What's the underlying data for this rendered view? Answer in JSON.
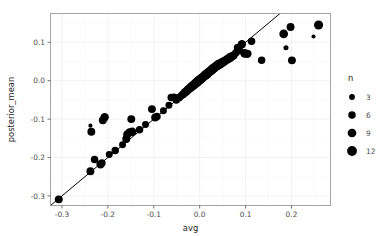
{
  "chart_data": {
    "type": "scatter",
    "title": "",
    "subtitle": "",
    "xlabel": "avg",
    "ylabel": "posterior_mean",
    "xlim": [
      -0.325,
      0.285
    ],
    "ylim": [
      -0.325,
      0.175
    ],
    "xticks": [
      -0.3,
      -0.2,
      -0.1,
      0.0,
      0.1,
      0.2
    ],
    "xticklabels": [
      "-0.3",
      "-0.2",
      "-0.1",
      "0.0",
      "0.1",
      "0.2"
    ],
    "yticks": [
      0.1,
      0.0,
      -0.1,
      -0.2,
      -0.3
    ],
    "yticklabels": [
      "0.1",
      "0.0",
      "-0.1",
      "-0.2",
      "-0.3"
    ],
    "grid": true,
    "grid_color": "#ececec",
    "point_color": "#000000",
    "size_variable": "n",
    "reference_line": {
      "type": "abline",
      "slope": 1,
      "intercept": 0,
      "color": "#000000"
    },
    "legend": {
      "title": "n",
      "position": "right",
      "entries": [
        {
          "label": "3",
          "value": 3
        },
        {
          "label": "6",
          "value": 6
        },
        {
          "label": "9",
          "value": 9
        },
        {
          "label": "12",
          "value": 12
        }
      ]
    },
    "points": [
      {
        "x": -0.307,
        "y": -0.309,
        "n": 7
      },
      {
        "x": -0.238,
        "y": -0.236,
        "n": 7
      },
      {
        "x": -0.236,
        "y": -0.133,
        "n": 7
      },
      {
        "x": -0.238,
        "y": -0.117,
        "n": 1
      },
      {
        "x": -0.229,
        "y": -0.205,
        "n": 6
      },
      {
        "x": -0.216,
        "y": -0.218,
        "n": 8
      },
      {
        "x": -0.213,
        "y": -0.214,
        "n": 6
      },
      {
        "x": -0.211,
        "y": -0.103,
        "n": 7
      },
      {
        "x": -0.207,
        "y": -0.095,
        "n": 8
      },
      {
        "x": -0.197,
        "y": -0.192,
        "n": 5
      },
      {
        "x": -0.184,
        "y": -0.182,
        "n": 6
      },
      {
        "x": -0.168,
        "y": -0.167,
        "n": 5
      },
      {
        "x": -0.16,
        "y": -0.152,
        "n": 7
      },
      {
        "x": -0.158,
        "y": -0.14,
        "n": 7
      },
      {
        "x": -0.153,
        "y": -0.135,
        "n": 8
      },
      {
        "x": -0.149,
        "y": -0.1,
        "n": 7
      },
      {
        "x": -0.147,
        "y": -0.133,
        "n": 8
      },
      {
        "x": -0.131,
        "y": -0.128,
        "n": 6
      },
      {
        "x": -0.118,
        "y": -0.114,
        "n": 5
      },
      {
        "x": -0.104,
        "y": -0.074,
        "n": 7
      },
      {
        "x": -0.097,
        "y": -0.096,
        "n": 7
      },
      {
        "x": -0.093,
        "y": -0.093,
        "n": 6
      },
      {
        "x": -0.079,
        "y": -0.078,
        "n": 5
      },
      {
        "x": -0.067,
        "y": -0.064,
        "n": 5
      },
      {
        "x": -0.062,
        "y": -0.044,
        "n": 6
      },
      {
        "x": -0.056,
        "y": -0.043,
        "n": 6
      },
      {
        "x": -0.051,
        "y": -0.05,
        "n": 6
      },
      {
        "x": -0.045,
        "y": -0.044,
        "n": 7
      },
      {
        "x": -0.04,
        "y": -0.039,
        "n": 6
      },
      {
        "x": -0.036,
        "y": -0.035,
        "n": 7
      },
      {
        "x": -0.032,
        "y": -0.03,
        "n": 8
      },
      {
        "x": -0.029,
        "y": -0.028,
        "n": 8
      },
      {
        "x": -0.026,
        "y": -0.024,
        "n": 9
      },
      {
        "x": -0.023,
        "y": -0.021,
        "n": 9
      },
      {
        "x": -0.02,
        "y": -0.018,
        "n": 9
      },
      {
        "x": -0.017,
        "y": -0.015,
        "n": 10
      },
      {
        "x": -0.014,
        "y": -0.012,
        "n": 10
      },
      {
        "x": -0.011,
        "y": -0.009,
        "n": 10
      },
      {
        "x": -0.008,
        "y": -0.006,
        "n": 10
      },
      {
        "x": -0.005,
        "y": -0.003,
        "n": 11
      },
      {
        "x": -0.002,
        "y": 0.0,
        "n": 11
      },
      {
        "x": 0.001,
        "y": 0.003,
        "n": 11
      },
      {
        "x": 0.004,
        "y": 0.006,
        "n": 11
      },
      {
        "x": 0.007,
        "y": 0.009,
        "n": 10
      },
      {
        "x": 0.01,
        "y": 0.012,
        "n": 10
      },
      {
        "x": 0.013,
        "y": 0.015,
        "n": 11
      },
      {
        "x": 0.016,
        "y": 0.018,
        "n": 11
      },
      {
        "x": 0.019,
        "y": 0.021,
        "n": 10
      },
      {
        "x": 0.022,
        "y": 0.024,
        "n": 10
      },
      {
        "x": 0.025,
        "y": 0.027,
        "n": 11
      },
      {
        "x": 0.028,
        "y": 0.03,
        "n": 11
      },
      {
        "x": 0.031,
        "y": 0.033,
        "n": 11
      },
      {
        "x": 0.034,
        "y": 0.036,
        "n": 10
      },
      {
        "x": 0.037,
        "y": 0.038,
        "n": 10
      },
      {
        "x": 0.04,
        "y": 0.041,
        "n": 11
      },
      {
        "x": 0.043,
        "y": 0.043,
        "n": 11
      },
      {
        "x": 0.046,
        "y": 0.045,
        "n": 10
      },
      {
        "x": 0.05,
        "y": 0.048,
        "n": 10
      },
      {
        "x": 0.054,
        "y": 0.051,
        "n": 9
      },
      {
        "x": 0.058,
        "y": 0.054,
        "n": 9
      },
      {
        "x": 0.062,
        "y": 0.057,
        "n": 9
      },
      {
        "x": 0.066,
        "y": 0.06,
        "n": 10
      },
      {
        "x": 0.07,
        "y": 0.063,
        "n": 8
      },
      {
        "x": 0.074,
        "y": 0.066,
        "n": 8
      },
      {
        "x": 0.079,
        "y": 0.073,
        "n": 6
      },
      {
        "x": 0.083,
        "y": 0.086,
        "n": 7
      },
      {
        "x": 0.086,
        "y": 0.079,
        "n": 7
      },
      {
        "x": 0.092,
        "y": 0.095,
        "n": 8
      },
      {
        "x": 0.098,
        "y": 0.071,
        "n": 9
      },
      {
        "x": 0.104,
        "y": 0.07,
        "n": 8
      },
      {
        "x": 0.113,
        "y": 0.103,
        "n": 6
      },
      {
        "x": 0.135,
        "y": 0.053,
        "n": 6
      },
      {
        "x": 0.183,
        "y": 0.122,
        "n": 9
      },
      {
        "x": 0.188,
        "y": 0.086,
        "n": 2
      },
      {
        "x": 0.198,
        "y": 0.14,
        "n": 7
      },
      {
        "x": 0.201,
        "y": 0.053,
        "n": 7
      },
      {
        "x": 0.248,
        "y": 0.115,
        "n": 1
      },
      {
        "x": 0.259,
        "y": 0.145,
        "n": 10
      }
    ]
  }
}
